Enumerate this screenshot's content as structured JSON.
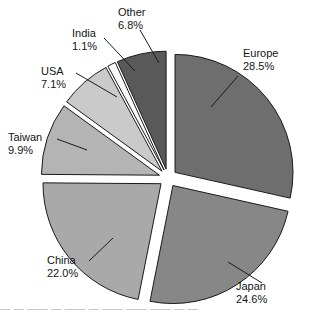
{
  "chart_data": {
    "type": "pie",
    "title": "",
    "xlabel": "",
    "ylabel": "",
    "legend_position": "none",
    "grid": false,
    "units": "percent",
    "exploded": true,
    "start_angle_deg": 0,
    "direction": "clockwise",
    "categories": [
      "Europe",
      "Japan",
      "China",
      "Taiwan",
      "USA",
      "India",
      "Other"
    ],
    "values": [
      28.5,
      24.6,
      22.0,
      9.9,
      7.1,
      1.1,
      6.8
    ],
    "slices": [
      {
        "name": "Europe",
        "value": 28.5,
        "label": "Europe",
        "percent_text": "28.5%",
        "color": "#6e6e6e",
        "start_deg": 0,
        "end_deg": 102.6,
        "label_x": 243,
        "label_y": 47,
        "label_align": "right",
        "leader": {
          "x1": 238,
          "y1": 76,
          "x2": 211,
          "y2": 107
        }
      },
      {
        "name": "Japan",
        "value": 24.6,
        "label": "Japan",
        "percent_text": "24.6%",
        "color": "#878787",
        "start_deg": 102.6,
        "end_deg": 191.2,
        "label_x": 236,
        "label_y": 280,
        "label_align": "right",
        "leader": {
          "x1": 262,
          "y1": 283,
          "x2": 228,
          "y2": 262
        }
      },
      {
        "name": "China",
        "value": 22.0,
        "label": "China",
        "percent_text": "22.0%",
        "color": "#a9a9a9",
        "start_deg": 191.2,
        "end_deg": 270.4,
        "label_x": 47,
        "label_y": 254,
        "label_align": "left",
        "leader": {
          "x1": 89,
          "y1": 261,
          "x2": 113,
          "y2": 238
        }
      },
      {
        "name": "Taiwan",
        "value": 9.9,
        "label": "Taiwan",
        "percent_text": "9.9%",
        "color": "#b4b4b4",
        "start_deg": 270.4,
        "end_deg": 306.0,
        "label_x": 8,
        "label_y": 131,
        "label_align": "left",
        "leader": {
          "x1": 57,
          "y1": 139,
          "x2": 87,
          "y2": 150
        }
      },
      {
        "name": "USA",
        "value": 7.1,
        "label": "USA",
        "percent_text": "7.1%",
        "color": "#cacaca",
        "start_deg": 306.0,
        "end_deg": 331.6,
        "label_x": 41,
        "label_y": 65,
        "label_align": "left",
        "leader": {
          "x1": 76,
          "y1": 73,
          "x2": 117,
          "y2": 97
        }
      },
      {
        "name": "India",
        "value": 1.1,
        "label": "India",
        "percent_text": "1.1%",
        "color": "#fafafa",
        "start_deg": 331.6,
        "end_deg": 335.6,
        "label_x": 72,
        "label_y": 27,
        "label_align": "left",
        "leader": {
          "x1": 104,
          "y1": 38,
          "x2": 135,
          "y2": 71
        }
      },
      {
        "name": "Other",
        "value": 6.8,
        "label": "Other",
        "percent_text": "6.8%",
        "color": "#595959",
        "start_deg": 335.6,
        "end_deg": 360.0,
        "label_x": 118,
        "label_y": 6,
        "label_align": "left",
        "leader": {
          "x1": 140,
          "y1": 30,
          "x2": 159,
          "y2": 63
        }
      }
    ]
  },
  "caption": {
    "cut_text": "—  —   ——  —   ——  —    ——   ——   ——  —   —"
  }
}
